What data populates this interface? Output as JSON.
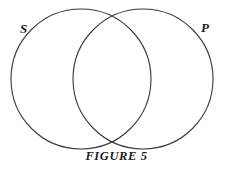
{
  "figure": {
    "caption": "FIGURE 5",
    "background_color": "#ffffff",
    "stroke_color": "#3a3a3a",
    "label_color": "#1a1a1a",
    "width": 233,
    "height": 171
  },
  "diagram": {
    "type": "venn-two-set",
    "left_circle": {
      "label": "S",
      "cx": 81,
      "cy": 79,
      "r": 70
    },
    "right_circle": {
      "label": "P",
      "cx": 143,
      "cy": 79,
      "r": 70
    },
    "labels": {
      "subject": "S",
      "predicate": "P"
    }
  }
}
